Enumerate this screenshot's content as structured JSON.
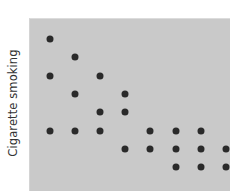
{
  "chart_data": {
    "type": "scatter",
    "title": "",
    "xlabel": "",
    "ylabel": "Cigarette smoking",
    "xlim": [
      0.5,
      8.5
    ],
    "ylim": [
      0.5,
      8.5
    ],
    "grid": false,
    "legend": null,
    "x_ticks": [],
    "y_ticks": [],
    "colors": {
      "plot_background": "#c9c9c9",
      "marker": "#2a2a2a",
      "label": "#333333"
    },
    "points": [
      {
        "x": 1,
        "y": 8
      },
      {
        "x": 2,
        "y": 7
      },
      {
        "x": 1,
        "y": 6
      },
      {
        "x": 3,
        "y": 6
      },
      {
        "x": 2,
        "y": 5
      },
      {
        "x": 4,
        "y": 5
      },
      {
        "x": 3,
        "y": 4
      },
      {
        "x": 4,
        "y": 4
      },
      {
        "x": 1,
        "y": 3
      },
      {
        "x": 2,
        "y": 3
      },
      {
        "x": 3,
        "y": 3
      },
      {
        "x": 5,
        "y": 3
      },
      {
        "x": 6,
        "y": 3
      },
      {
        "x": 7,
        "y": 3
      },
      {
        "x": 4,
        "y": 2
      },
      {
        "x": 5,
        "y": 2
      },
      {
        "x": 6,
        "y": 2
      },
      {
        "x": 7,
        "y": 2
      },
      {
        "x": 8,
        "y": 2
      },
      {
        "x": 6,
        "y": 1
      },
      {
        "x": 7,
        "y": 1
      },
      {
        "x": 8,
        "y": 1
      }
    ]
  }
}
